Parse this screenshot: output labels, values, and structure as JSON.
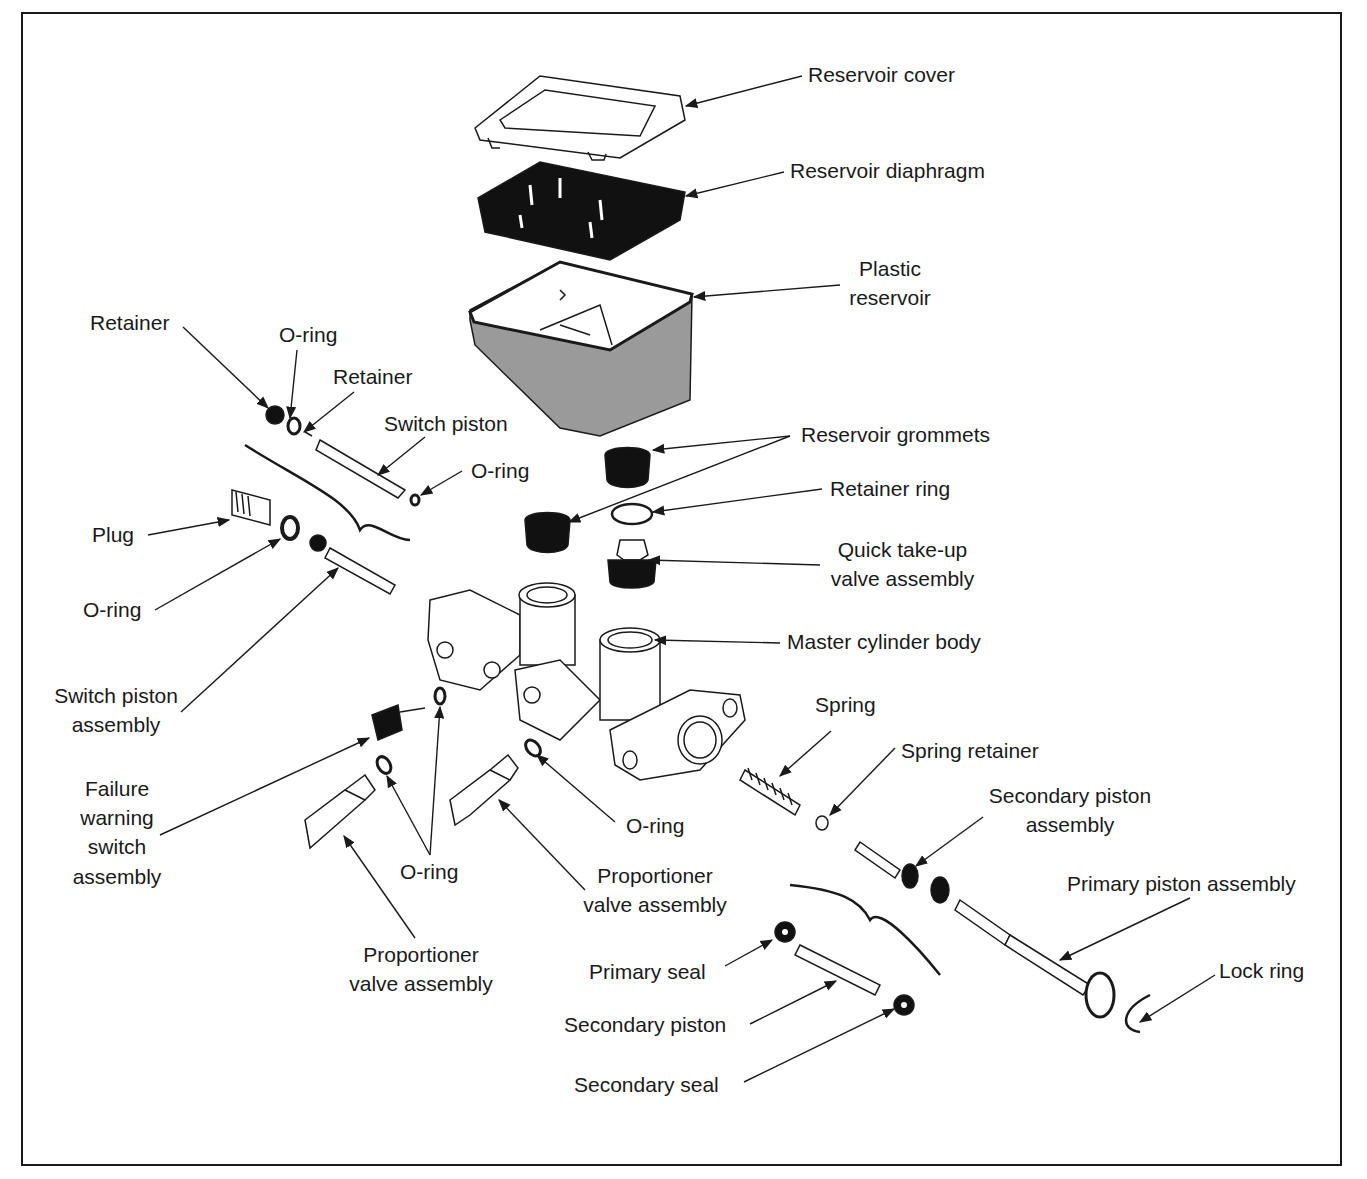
{
  "diagram": {
    "colors": {
      "ink": "#1a1a1a",
      "reservoir_fill": "#9a9a9a",
      "background": "#ffffff"
    },
    "labels": {
      "reservoir_cover": "Reservoir cover",
      "reservoir_diaphragm": "Reservoir diaphragm",
      "plastic_reservoir_1": "Plastic",
      "plastic_reservoir_2": "reservoir",
      "retainer_1": "Retainer",
      "oring_top": "O-ring",
      "retainer_2": "Retainer",
      "switch_piston": "Switch piston",
      "oring_switch": "O-ring",
      "reservoir_grommets": "Reservoir grommets",
      "retainer_ring": "Retainer ring",
      "quick_takeup_1": "Quick take-up",
      "quick_takeup_2": "valve assembly",
      "plug": "Plug",
      "oring_plug": "O-ring",
      "master_cylinder_body": "Master cylinder body",
      "switch_piston_assembly_1": "Switch piston",
      "switch_piston_assembly_2": "assembly",
      "spring": "Spring",
      "spring_retainer": "Spring retainer",
      "failure_1": "Failure",
      "failure_2": "warning",
      "failure_3": "switch",
      "failure_4": "assembly",
      "oring_body": "O-ring",
      "secondary_piston_assembly_1": "Secondary piston",
      "secondary_piston_assembly_2": "assembly",
      "oring_pair": "O-ring",
      "proportioner_right_1": "Proportioner",
      "proportioner_right_2": "valve assembly",
      "primary_piston_assembly": "Primary piston assembly",
      "proportioner_left_1": "Proportioner",
      "proportioner_left_2": "valve assembly",
      "primary_seal": "Primary seal",
      "lock_ring": "Lock ring",
      "secondary_piston": "Secondary piston",
      "secondary_seal": "Secondary seal"
    }
  }
}
